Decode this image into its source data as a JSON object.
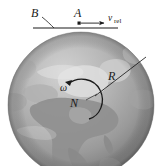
{
  "figure": {
    "type": "physics-diagram",
    "background_color": "#ffffff",
    "globe": {
      "name": "earth-sphere",
      "center_x": 81,
      "center_y": 105,
      "radius": 73,
      "ocean_color": "#9d9d9d",
      "land_color": "#cfcfcf",
      "highlight_color": "#e3e3e3",
      "shadow_color": "#6f6f6f",
      "continent_label": "North America"
    },
    "labels": {
      "point_b": "B",
      "point_a": "A",
      "radius": "R",
      "north_pole": "N",
      "omega": "ω",
      "velocity_symbol": "v",
      "velocity_subscript": "rel"
    },
    "line": {
      "name": "tangent-line",
      "x1": 33,
      "y1": 28,
      "x2": 118,
      "y2": 28,
      "color": "#1a1a1a"
    },
    "velocity_arrow": {
      "from_x": 80,
      "from_y": 23,
      "to_x": 106,
      "to_y": 23,
      "color": "#1a1a1a"
    },
    "particle_marker": {
      "x": 79,
      "y": 23,
      "size": 3,
      "color": "#1a1a1a"
    },
    "radius_line": {
      "from_x": 95,
      "from_y": 96,
      "to_x": 146,
      "to_y": 57,
      "color": "#1a1a1a"
    },
    "omega_arc": {
      "description": "curved rotation arrow about polar axis, counterclockwise",
      "color": "#1a1a1a"
    },
    "b_leader": {
      "description": "leader line from label B down-right to tangent line",
      "from_x": 42,
      "from_y": 17,
      "to_x": 54,
      "to_y": 28
    }
  }
}
